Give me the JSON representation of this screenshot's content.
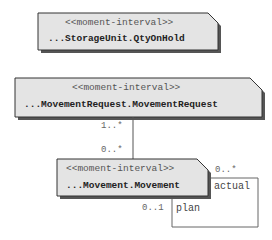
{
  "diagram": {
    "type": "uml-class-diagram",
    "colors": {
      "box_fill": "#e4e4e4",
      "box_stroke": "#333333",
      "shadow": "#555555",
      "line": "#555555"
    },
    "classes": [
      {
        "id": "storage",
        "stereotype": "<<moment-interval>>",
        "name": "...StorageUnit.QtyOnHold"
      },
      {
        "id": "request",
        "stereotype": "<<moment-interval>>",
        "name": "...MovementRequest.MovementRequest"
      },
      {
        "id": "movement",
        "stereotype": "<<moment-interval>>",
        "name": "...Movement.Movement"
      }
    ],
    "associations": [
      {
        "from": "request",
        "to": "movement",
        "from_mult": "1..*",
        "to_mult": "0..*"
      },
      {
        "from": "movement",
        "to": "movement",
        "roles": [
          "actual",
          "plan"
        ],
        "mult_actual": "0..*",
        "mult_plan": "0..1"
      }
    ]
  }
}
